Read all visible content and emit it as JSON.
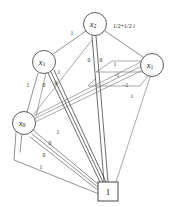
{
  "diagram": {
    "type": "decision-diagram",
    "background_color": "#ffffff",
    "line_color": "#555555",
    "text_color": "#1a1a1a",
    "nodes": [
      {
        "id": "x2-top",
        "var": "x",
        "sub": "2",
        "label": "x2",
        "shape": "circle",
        "cx": 95,
        "cy": 24,
        "r": 11.5
      },
      {
        "id": "x1-left",
        "var": "x",
        "sub": "1",
        "label": "x1",
        "shape": "circle",
        "cx": 44,
        "cy": 62,
        "r": 11.5
      },
      {
        "id": "x1-right",
        "var": "x",
        "sub": "1",
        "label": "x1",
        "shape": "circle",
        "cx": 152,
        "cy": 65,
        "r": 11.5
      },
      {
        "id": "x0-bottom",
        "var": "x",
        "sub": "0",
        "label": "x0",
        "shape": "circle",
        "cx": 24,
        "cy": 123,
        "r": 11.5
      },
      {
        "id": "terminal-1",
        "label": "1",
        "shape": "square",
        "x": 98,
        "y": 182,
        "w": 20,
        "h": 19
      }
    ],
    "edge_labels": [
      {
        "id": "lbl-x2-x1left",
        "text": "1",
        "x": 72,
        "y": 33
      },
      {
        "id": "lbl-x2-down-a",
        "text": "0",
        "x": 89,
        "y": 60
      },
      {
        "id": "lbl-x2-down-b",
        "text": "0",
        "x": 101,
        "y": 60
      },
      {
        "id": "lbl-x1right-in",
        "text": "1",
        "x": 115,
        "y": 64
      },
      {
        "id": "lbl-x1left-a",
        "text": "1",
        "x": 59,
        "y": 72
      },
      {
        "id": "lbl-x1left-b",
        "text": "1",
        "x": 28,
        "y": 85
      },
      {
        "id": "lbl-x1left-c",
        "text": "0",
        "x": 44,
        "y": 85
      },
      {
        "id": "lbl-x1left-d",
        "text": "0",
        "x": 56,
        "y": 83
      },
      {
        "id": "lbl-right-neg-a",
        "text": "-1",
        "x": 117,
        "y": 75
      },
      {
        "id": "lbl-right-neg-b",
        "text": "-1",
        "x": 126,
        "y": 85
      },
      {
        "id": "lbl-right-one",
        "text": "1",
        "x": 132,
        "y": 96
      },
      {
        "id": "lbl-x0-a",
        "text": "1",
        "x": 58,
        "y": 132
      },
      {
        "id": "lbl-x0-b",
        "text": "0",
        "x": 50,
        "y": 143
      },
      {
        "id": "lbl-x0-c",
        "text": "0",
        "x": 44,
        "y": 155
      },
      {
        "id": "lbl-x0-d",
        "text": "1",
        "x": 41,
        "y": 167
      }
    ],
    "weights": [
      {
        "id": "weight-complex",
        "text": "1/2+1/2",
        "suffix": "i",
        "x": 113,
        "y": 26
      }
    ]
  }
}
